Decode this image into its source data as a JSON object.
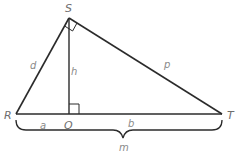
{
  "diagram": {
    "type": "right-triangle-with-altitude",
    "colors": {
      "line": "#2b2b2b",
      "label": "#7a7a7a",
      "background": "#ffffff"
    },
    "vertices": {
      "S": {
        "label": "S",
        "x": 69,
        "y": 18
      },
      "R": {
        "label": "R",
        "x": 16,
        "y": 114
      },
      "Q": {
        "label": "Q",
        "x": 69,
        "y": 114
      },
      "T": {
        "label": "T",
        "x": 222,
        "y": 114
      }
    },
    "segments": {
      "d": {
        "label": "d",
        "from": "R",
        "to": "S"
      },
      "h": {
        "label": "h",
        "from": "S",
        "to": "Q"
      },
      "p": {
        "label": "p",
        "from": "S",
        "to": "T"
      },
      "a": {
        "label": "a",
        "from": "R",
        "to": "Q"
      },
      "b": {
        "label": "b",
        "from": "Q",
        "to": "T"
      },
      "m": {
        "label": "m",
        "from": "R",
        "to": "T"
      }
    },
    "right_angles": [
      "S",
      "Q"
    ]
  }
}
